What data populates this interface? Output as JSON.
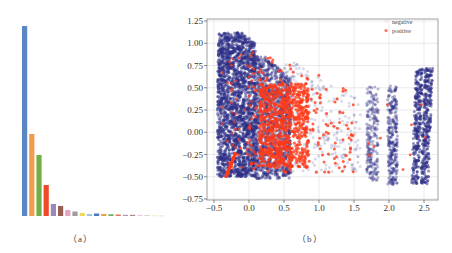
{
  "panels": {
    "a": {
      "caption": "（a）"
    },
    "b": {
      "caption": "（b）"
    }
  },
  "colors": {
    "negative": "#2e2f86",
    "positive": "#ff3b1a",
    "grid": "#dcdcdc",
    "frame": "#888888"
  },
  "chart_data": [
    {
      "type": "bar",
      "panel": "a",
      "title": "",
      "xlabel": "",
      "ylabel": "",
      "axes_visible": false,
      "categories": [
        "1",
        "2",
        "3",
        "4",
        "5",
        "6",
        "7",
        "8",
        "9",
        "10",
        "11",
        "12",
        "13",
        "14",
        "15",
        "16",
        "17",
        "18",
        "19",
        "20"
      ],
      "values": [
        190,
        82,
        61,
        31,
        12,
        10,
        6,
        4.5,
        3,
        2,
        2.5,
        2,
        1.8,
        1.5,
        1.2,
        1.2,
        0.9,
        0.8,
        0.6,
        0.5
      ],
      "bar_colors": [
        "#5b86c6",
        "#f39a4c",
        "#72ad48",
        "#ee4a2a",
        "#9b87bc",
        "#9a5b50",
        "#e5a3c6",
        "#9d9d9d",
        "#f2d65c",
        "#8fc9e8",
        "#4e78c0",
        "#e8a048",
        "#7ab060",
        "#e07a5a",
        "#a898c8",
        "#b08a80",
        "#ecc0d8",
        "#c8c8c8",
        "#f5e6a0",
        "#c4e2f2"
      ],
      "ylim": [
        0,
        200
      ]
    },
    {
      "type": "scatter",
      "panel": "b",
      "title": "",
      "xlabel": "",
      "ylabel": "",
      "xlim": [
        -0.6,
        2.7
      ],
      "ylim": [
        -0.75,
        1.25
      ],
      "xticks": [
        "-0.5",
        "0.0",
        "0.5",
        "1.0",
        "1.5",
        "2.0",
        "2.5"
      ],
      "xtick_values": [
        -0.5,
        0.0,
        0.5,
        1.0,
        1.5,
        2.0,
        2.5
      ],
      "yticks": [
        "1.25",
        "1.00",
        "0.75",
        "0.50",
        "0.25",
        "0.00",
        "-0.25",
        "-0.50",
        "-0.75"
      ],
      "ytick_values": [
        1.25,
        1.0,
        0.75,
        0.5,
        0.25,
        0.0,
        -0.25,
        -0.5,
        -0.75
      ],
      "grid": true,
      "legend": {
        "position": "upper right",
        "entries": [
          "negative",
          "positive"
        ]
      },
      "series": [
        {
          "name": "negative",
          "color": "#2e2f86",
          "description": "dense cluster x in [-0.45, 0.5], y in [-0.5, 1.12]; sparse halo to x~1.6; vertical streaks at x~1.75, 2.05, 2.38, 2.5",
          "clusters": [
            {
              "x_range": [
                -0.45,
                0.1
              ],
              "y_range": [
                -0.5,
                1.12
              ],
              "density": "very high"
            },
            {
              "x_range": [
                0.1,
                0.6
              ],
              "y_range": [
                -0.5,
                0.8
              ],
              "density": "high"
            },
            {
              "x_range": [
                0.6,
                1.6
              ],
              "y_range": [
                -0.4,
                0.7
              ],
              "density": "low"
            },
            {
              "x_range": [
                1.68,
                1.85
              ],
              "y_range": [
                -0.55,
                0.52
              ],
              "density": "medium"
            },
            {
              "x_range": [
                1.98,
                2.12
              ],
              "y_range": [
                -0.6,
                0.52
              ],
              "density": "medium"
            },
            {
              "x_range": [
                2.32,
                2.42
              ],
              "y_range": [
                -0.58,
                0.72
              ],
              "density": "high"
            },
            {
              "x_range": [
                2.45,
                2.58
              ],
              "y_range": [
                -0.58,
                0.72
              ],
              "density": "high"
            }
          ]
        },
        {
          "name": "positive",
          "color": "#ff3b1a",
          "description": "main cluster x in [0.1, 0.9], y in [-0.4, 0.8]; scattered points to x~1.5; small diagonal streak near x=-0.3,y=-0.4",
          "clusters": [
            {
              "x_range": [
                0.15,
                0.85
              ],
              "y_range": [
                -0.4,
                0.6
              ],
              "density": "high"
            },
            {
              "x_range": [
                0.0,
                1.5
              ],
              "y_range": [
                -0.45,
                0.95
              ],
              "density": "low"
            },
            {
              "x_range": [
                -0.33,
                -0.18
              ],
              "y_range": [
                -0.5,
                -0.22
              ],
              "density": "streak"
            }
          ]
        }
      ]
    }
  ]
}
